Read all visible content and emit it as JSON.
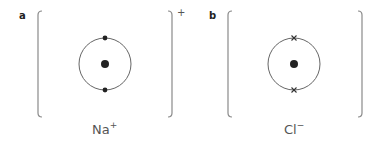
{
  "panels": [
    {
      "id": "a",
      "label": "a",
      "ion": "Na",
      "ion_charge": "+",
      "bracket_charge": "+",
      "electron_marker": "dot",
      "shell_electrons": 2
    },
    {
      "id": "b",
      "label": "b",
      "ion": "Cl",
      "ion_charge": "−",
      "bracket_charge": "",
      "electron_marker": "cross",
      "shell_electrons": 2
    }
  ],
  "colors": {
    "line": "#666666",
    "bracket": "#8a8a8a",
    "nucleus": "#222222",
    "text": "#555555"
  }
}
